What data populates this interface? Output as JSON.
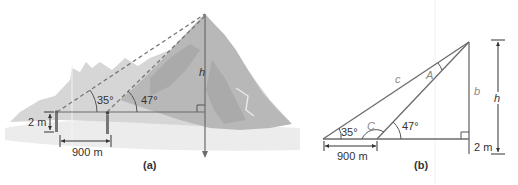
{
  "figure_a": {
    "caption": "(a)",
    "angle_1": "35°",
    "angle_2": "47°",
    "height_label": "h",
    "eye_height": "2 m",
    "distance": "900 m"
  },
  "figure_b": {
    "caption": "(b)",
    "angle_1": "35°",
    "angle_2": "47°",
    "angle_C": "C",
    "angle_A": "A",
    "side_c": "c",
    "side_b": "b",
    "height_label": "h",
    "eye_height": "2 m",
    "distance": "900 m"
  },
  "colors": {
    "line": "#6b6b6b",
    "mountain_light": "#d4d4d4",
    "mountain_mid": "#bcbcbc",
    "mountain_dark": "#a8a8a8",
    "ground": "#e6e6e6"
  }
}
